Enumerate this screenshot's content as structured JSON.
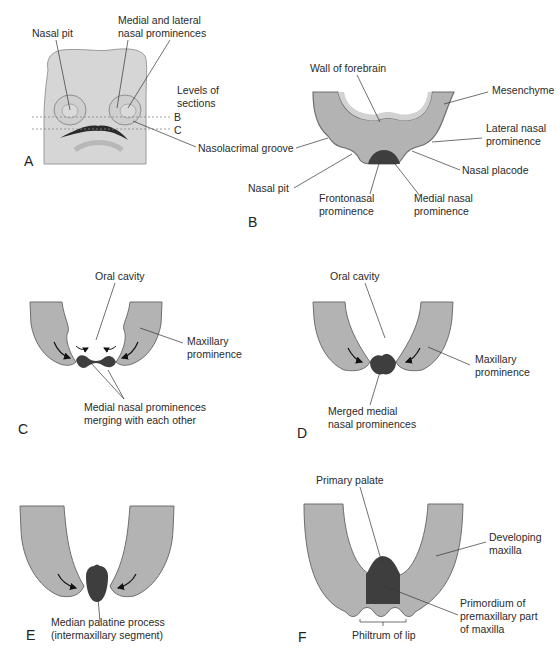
{
  "figure": {
    "colors": {
      "tissue": "#b3b3b3",
      "tissue_edge": "#6e6e6e",
      "inner_layer": "#cdcdcd",
      "dark_tissue": "#3e3e3e",
      "face": "#d6d6d6",
      "leader_line": "#333333"
    },
    "panels": [
      {
        "letter": "A",
        "labels": {
          "nasal_pit": "Nasal pit",
          "medial_lateral": "Medial and lateral\nnasal prominences",
          "levels": "Levels of\nsections",
          "level_b": "B",
          "level_c": "C",
          "nasolacrimal": "Nasolacrimal groove"
        }
      },
      {
        "letter": "B",
        "labels": {
          "wall_forebrain": "Wall of forebrain",
          "mesenchyme": "Mesenchyme",
          "lateral_nasal": "Lateral nasal\nprominence",
          "nasal_placode": "Nasal placode",
          "nasal_pit": "Nasal pit",
          "frontonasal": "Frontonasal\nprominence",
          "medial_nasal": "Medial nasal\nprominence"
        }
      },
      {
        "letter": "C",
        "labels": {
          "oral_cavity": "Oral cavity",
          "maxillary": "Maxillary\nprominence",
          "medial_merging": "Medial nasal prominences\nmerging with each other"
        }
      },
      {
        "letter": "D",
        "labels": {
          "oral_cavity": "Oral cavity",
          "maxillary": "Maxillary\nprominence",
          "merged_medial": "Merged medial\nnasal prominences"
        }
      },
      {
        "letter": "E",
        "labels": {
          "median_palatine": "Median palatine process\n(intermaxillary segment)"
        }
      },
      {
        "letter": "F",
        "labels": {
          "primary_palate": "Primary palate",
          "developing_maxilla": "Developing\nmaxilla",
          "primordium": "Primordium of\npremaxillary part\nof maxilla",
          "philtrum": "Philtrum of lip"
        }
      }
    ]
  }
}
